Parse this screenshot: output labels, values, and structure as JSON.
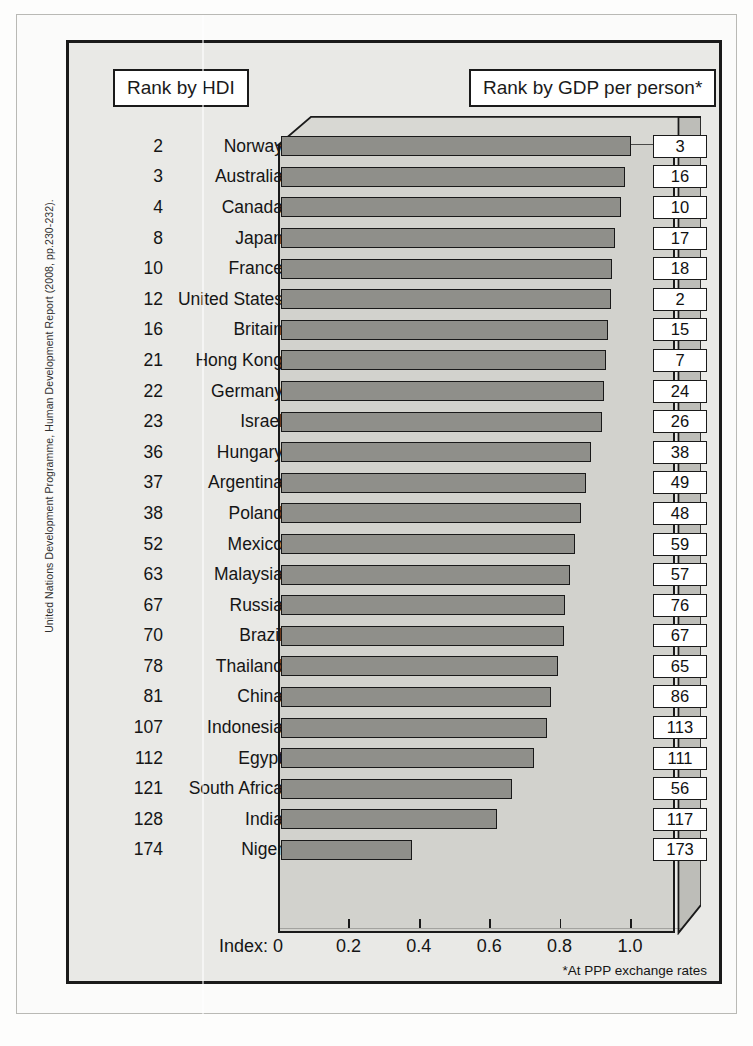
{
  "source_credit": "United Nations Development Programme, Human Development Report (2008, pp.230-232).",
  "callouts": {
    "left_label": "Rank by HDI",
    "right_label": "Rank by GDP per person*"
  },
  "axis": {
    "title": "Index:",
    "ticks": [
      "0",
      "0.2",
      "0.4",
      "0.6",
      "0.8",
      "1.0"
    ]
  },
  "footnote": "*At PPP exchange rates",
  "colors": {
    "bar_fill": "#8f8f8a",
    "bar_stroke": "#191919",
    "panel_bg": "#e9e9e6",
    "block_face": "#d2d2cd",
    "callout_bg": "#ffffff"
  },
  "chart_data": {
    "type": "bar",
    "xlabel": "Index:",
    "ylabel": "",
    "xlim": [
      0,
      1.15
    ],
    "grid": false,
    "orientation": "horizontal",
    "legend": "none",
    "annotations": [
      "*At PPP exchange rates"
    ],
    "columns": [
      "Rank by HDI",
      "Country",
      "HDI index",
      "Rank by GDP per person"
    ],
    "categories": [
      "Norway",
      "Australia",
      "Canada",
      "Japan",
      "France",
      "United States",
      "Britain",
      "Hong Kong",
      "Germany",
      "Israel",
      "Hungary",
      "Argentina",
      "Poland",
      "Mexico",
      "Malaysia",
      "Russia",
      "Brazil",
      "Thailand",
      "China",
      "Indonesia",
      "Egypt",
      "South Africa",
      "India",
      "Niger"
    ],
    "values": [
      0.995,
      0.978,
      0.965,
      0.948,
      0.941,
      0.937,
      0.928,
      0.922,
      0.918,
      0.913,
      0.88,
      0.866,
      0.852,
      0.834,
      0.822,
      0.808,
      0.805,
      0.786,
      0.768,
      0.755,
      0.719,
      0.656,
      0.615,
      0.372
    ],
    "rows": [
      {
        "hdi_rank": "2",
        "country": "Norway",
        "index": 0.995,
        "gdp_rank": "3"
      },
      {
        "hdi_rank": "3",
        "country": "Australia",
        "index": 0.978,
        "gdp_rank": "16"
      },
      {
        "hdi_rank": "4",
        "country": "Canada",
        "index": 0.965,
        "gdp_rank": "10"
      },
      {
        "hdi_rank": "8",
        "country": "Japan",
        "index": 0.948,
        "gdp_rank": "17"
      },
      {
        "hdi_rank": "10",
        "country": "France",
        "index": 0.941,
        "gdp_rank": "18"
      },
      {
        "hdi_rank": "12",
        "country": "United States",
        "index": 0.937,
        "gdp_rank": "2"
      },
      {
        "hdi_rank": "16",
        "country": "Britain",
        "index": 0.928,
        "gdp_rank": "15"
      },
      {
        "hdi_rank": "21",
        "country": "Hong Kong",
        "index": 0.922,
        "gdp_rank": "7"
      },
      {
        "hdi_rank": "22",
        "country": "Germany",
        "index": 0.918,
        "gdp_rank": "24"
      },
      {
        "hdi_rank": "23",
        "country": "Israel",
        "index": 0.913,
        "gdp_rank": "26"
      },
      {
        "hdi_rank": "36",
        "country": "Hungary",
        "index": 0.88,
        "gdp_rank": "38"
      },
      {
        "hdi_rank": "37",
        "country": "Argentina",
        "index": 0.866,
        "gdp_rank": "49"
      },
      {
        "hdi_rank": "38",
        "country": "Poland",
        "index": 0.852,
        "gdp_rank": "48"
      },
      {
        "hdi_rank": "52",
        "country": "Mexico",
        "index": 0.834,
        "gdp_rank": "59"
      },
      {
        "hdi_rank": "63",
        "country": "Malaysia",
        "index": 0.822,
        "gdp_rank": "57"
      },
      {
        "hdi_rank": "67",
        "country": "Russia",
        "index": 0.808,
        "gdp_rank": "76"
      },
      {
        "hdi_rank": "70",
        "country": "Brazil",
        "index": 0.805,
        "gdp_rank": "67"
      },
      {
        "hdi_rank": "78",
        "country": "Thailand",
        "index": 0.786,
        "gdp_rank": "65"
      },
      {
        "hdi_rank": "81",
        "country": "China",
        "index": 0.768,
        "gdp_rank": "86"
      },
      {
        "hdi_rank": "107",
        "country": "Indonesia",
        "index": 0.755,
        "gdp_rank": "113"
      },
      {
        "hdi_rank": "112",
        "country": "Egypt",
        "index": 0.719,
        "gdp_rank": "111"
      },
      {
        "hdi_rank": "121",
        "country": "South Africa",
        "index": 0.656,
        "gdp_rank": "56"
      },
      {
        "hdi_rank": "128",
        "country": "India",
        "index": 0.615,
        "gdp_rank": "117"
      },
      {
        "hdi_rank": "174",
        "country": "Niger",
        "index": 0.372,
        "gdp_rank": "173"
      }
    ]
  }
}
